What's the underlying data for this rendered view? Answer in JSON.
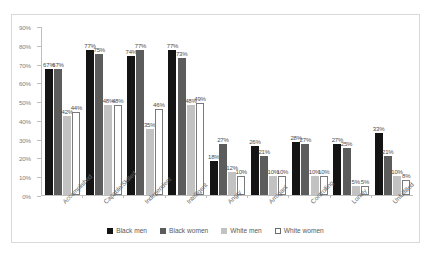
{
  "chart_data": {
    "type": "bar",
    "title": "",
    "xlabel": "",
    "ylabel": "",
    "ylim": [
      0,
      90
    ],
    "ytick_labels": [
      "0%",
      "10%",
      "20%",
      "30%",
      "40%",
      "50%",
      "60%",
      "70%",
      "80%",
      "90%"
    ],
    "ytick_values": [
      0,
      10,
      20,
      30,
      40,
      50,
      60,
      70,
      80,
      90
    ],
    "grid": false,
    "legend_position": "bottom",
    "value_label_suffix": "%",
    "categories": [
      "Accomplished",
      "Capable/Skilled",
      "Independent",
      "Intelligent",
      "Angry",
      "Arrogant",
      "Controlling",
      "Lonely",
      "Unfulfilled"
    ],
    "series": [
      {
        "name": "Black men",
        "color": "#141414",
        "values": [
          67,
          77,
          74,
          77,
          18,
          26,
          28,
          27,
          33
        ]
      },
      {
        "name": "Black women",
        "color": "#5c5c5c",
        "values": [
          67,
          75,
          77,
          73,
          27,
          21,
          27,
          25,
          21
        ]
      },
      {
        "name": "White men",
        "color": "#c2c2c2",
        "values": [
          42,
          48,
          35,
          48,
          12,
          10,
          10,
          5,
          10
        ]
      },
      {
        "name": "White women",
        "color": "#ffffff",
        "values": [
          44,
          48,
          46,
          49,
          10,
          10,
          10,
          5,
          8
        ]
      }
    ]
  }
}
